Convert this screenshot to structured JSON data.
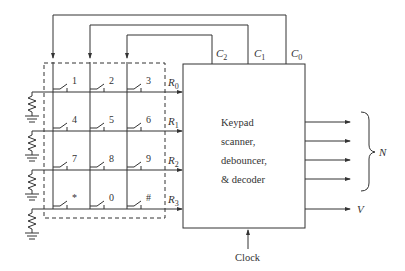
{
  "figure": {
    "type": "keypad-scanner-circuit",
    "block": {
      "label_lines": [
        "Keypad",
        "scanner,",
        "debouncer,",
        "& decoder"
      ]
    },
    "columns": [
      {
        "name": "C",
        "sub": "2"
      },
      {
        "name": "C",
        "sub": "1"
      },
      {
        "name": "C",
        "sub": "0"
      }
    ],
    "rows": [
      {
        "name": "R",
        "sub": "0"
      },
      {
        "name": "R",
        "sub": "1"
      },
      {
        "name": "R",
        "sub": "2"
      },
      {
        "name": "R",
        "sub": "3"
      }
    ],
    "keys": [
      [
        "1",
        "2",
        "3"
      ],
      [
        "4",
        "5",
        "6"
      ],
      [
        "7",
        "8",
        "9"
      ],
      [
        "*",
        "0",
        "#"
      ]
    ],
    "outputs": {
      "bus_label": "N",
      "bus_count": 4,
      "valid_label": "V"
    },
    "clock_label": "Clock",
    "colors": {
      "line": "#333333",
      "background": "#ffffff"
    }
  }
}
